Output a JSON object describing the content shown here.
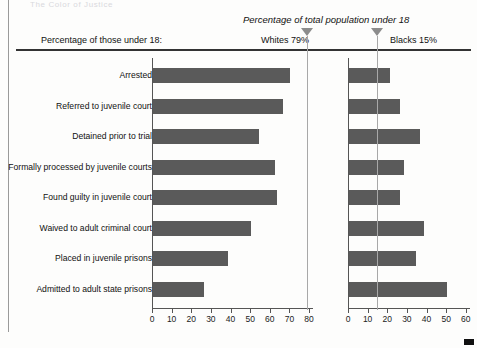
{
  "header": {
    "cut_off_text": "The Color of Justice",
    "italic_note": "Percentage of total population under 18",
    "left_label": "Percentage of those under 18:",
    "whites_marker_label": "Whites 79%",
    "blacks_marker_label": "Blacks 15%"
  },
  "colors": {
    "bar": "#5a5a5a",
    "axis": "#555555",
    "marker": "#8c8c8c",
    "rule": "#333333",
    "background": "#fdfdfc"
  },
  "markers": {
    "whites_value": 79,
    "blacks_value": 15
  },
  "chart_data": {
    "type": "bar",
    "title": "Percentage of total population under 18",
    "orientation": "horizontal",
    "categories": [
      "Arrested",
      "Referred to juvenile court",
      "Detained prior to trial",
      "Formally processed by juvenile courts",
      "Found guilty in juvenile court",
      "Waived to adult criminal court",
      "Placed in juvenile prisons",
      "Admitted to adult state prisons"
    ],
    "series": [
      {
        "name": "Whites",
        "panel": "left",
        "values": [
          70,
          66,
          54,
          62,
          63,
          50,
          38,
          26
        ],
        "xlim": [
          0,
          80
        ],
        "xticks": [
          0,
          10,
          20,
          30,
          40,
          50,
          60,
          70,
          80
        ],
        "reference_line": 79,
        "reference_label": "Whites 79%"
      },
      {
        "name": "Blacks",
        "panel": "right",
        "values": [
          21,
          26,
          36,
          28,
          26,
          38,
          34,
          50
        ],
        "xlim": [
          0,
          60
        ],
        "xticks": [
          0,
          10,
          20,
          30,
          40,
          50,
          60
        ],
        "reference_line": 15,
        "reference_label": "Blacks 15%"
      }
    ],
    "xlabel": "",
    "ylabel": "",
    "grid": false,
    "legend_position": "top"
  },
  "left_ticks": [
    "0",
    "10",
    "20",
    "30",
    "40",
    "50",
    "60",
    "70",
    "80"
  ],
  "right_ticks": [
    "0",
    "10",
    "20",
    "30",
    "40",
    "50",
    "60"
  ]
}
